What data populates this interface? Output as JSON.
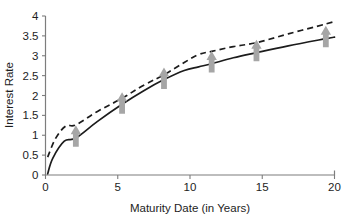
{
  "chart_data": {
    "type": "line",
    "title": "",
    "xlabel": "Maturity Date (in Years)",
    "ylabel": "Interest Rate",
    "xlim": [
      0,
      20
    ],
    "ylim": [
      0,
      4
    ],
    "xticks": [
      "0",
      "5",
      "10",
      "15",
      "20"
    ],
    "xtick_values": [
      0,
      5,
      10,
      15,
      20
    ],
    "yticks": [
      "0",
      "0.5",
      "1",
      "1.5",
      "2",
      "2.5",
      "3",
      "3.5",
      "4"
    ],
    "ytick_values": [
      0,
      0.5,
      1,
      1.5,
      2,
      2.5,
      3,
      3.5,
      4
    ],
    "grid": false,
    "legend": "none",
    "series": [
      {
        "name": "solid-curve",
        "style": "solid",
        "color": "#1c1c1c",
        "x": [
          0.15,
          0.5,
          1.3,
          2.1,
          3.6,
          5.3,
          6.8,
          8.2,
          9.6,
          10.6,
          11.5,
          13.0,
          14.6,
          16.8,
          19.4,
          20.0
        ],
        "y": [
          0.03,
          0.42,
          0.85,
          0.93,
          1.35,
          1.78,
          2.12,
          2.4,
          2.63,
          2.72,
          2.8,
          2.95,
          3.08,
          3.25,
          3.43,
          3.47
        ]
      },
      {
        "name": "dashed-curve",
        "style": "dashed",
        "color": "#1c1c1c",
        "x": [
          0.15,
          0.7,
          1.4,
          2.1,
          3.6,
          5.3,
          6.8,
          8.2,
          9.6,
          10.6,
          11.5,
          13.0,
          14.6,
          16.8,
          19.4,
          20.0
        ],
        "y": [
          0.45,
          0.92,
          1.23,
          1.26,
          1.6,
          1.93,
          2.26,
          2.52,
          2.83,
          3.03,
          3.11,
          3.23,
          3.33,
          3.55,
          3.8,
          3.86
        ]
      }
    ],
    "markers": {
      "name": "up-arrow-markers",
      "shape": "up-arrow",
      "color": "#a6a6a6",
      "points": [
        {
          "x": 2.1,
          "y": 0.95
        },
        {
          "x": 5.3,
          "y": 1.78
        },
        {
          "x": 8.2,
          "y": 2.4
        },
        {
          "x": 11.5,
          "y": 2.82
        },
        {
          "x": 14.6,
          "y": 3.1
        },
        {
          "x": 19.4,
          "y": 3.45
        }
      ]
    }
  }
}
